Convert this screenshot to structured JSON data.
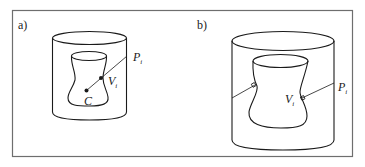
{
  "figure": {
    "panels": [
      {
        "label": "a)",
        "points": {
          "P": {
            "base": "P",
            "sub": "i"
          },
          "V": {
            "base": "V",
            "sub": "i"
          },
          "C": {
            "base": "C"
          }
        }
      },
      {
        "label": "b)",
        "points": {
          "P": {
            "base": "P",
            "sub": "i"
          },
          "V": {
            "base": "V",
            "sub": "i"
          }
        }
      }
    ],
    "colors": {
      "frame": "#6e6e6e",
      "line": "#1a1a1a",
      "background": "#ffffff"
    }
  }
}
